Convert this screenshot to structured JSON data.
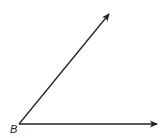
{
  "diagram": {
    "type": "angle",
    "vertex": {
      "label": "B",
      "x": 19,
      "y": 124
    },
    "rays": [
      {
        "name": "horizontal-ray",
        "x2": 157,
        "y2": 124
      },
      {
        "name": "diagonal-ray",
        "x2": 109,
        "y2": 14
      }
    ],
    "colors": {
      "stroke": "#222222",
      "background": "#ffffff"
    }
  }
}
